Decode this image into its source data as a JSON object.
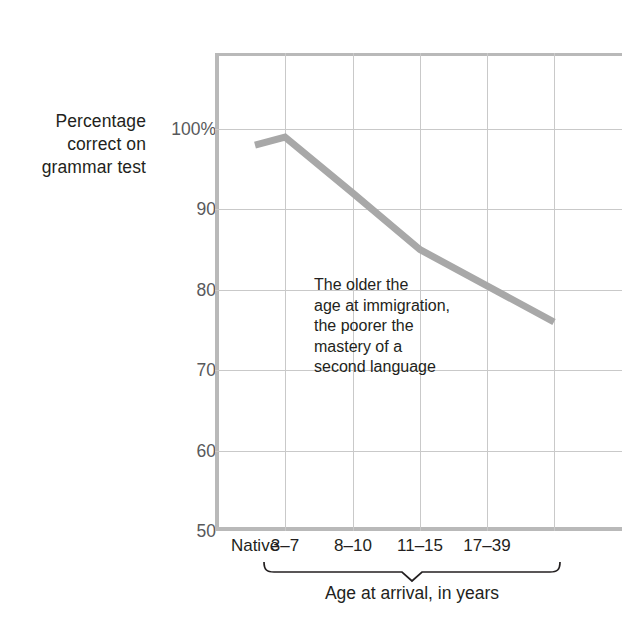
{
  "chart_data": {
    "type": "line",
    "title": "",
    "subtitle": "",
    "xlabel": "Age at arrival, in years",
    "ylabel": "Percentage correct on grammar test",
    "categories": [
      "Native",
      "3–7",
      "8–10",
      "11–15",
      "17–39"
    ],
    "values": [
      98,
      99,
      92,
      85,
      76
    ],
    "series": [
      {
        "name": "Percentage correct on grammar test",
        "values": [
          98,
          99,
          92,
          85,
          76
        ]
      }
    ],
    "ylim": [
      50,
      100
    ],
    "yticks": [
      50,
      60,
      70,
      80,
      90,
      100
    ],
    "ytick_labels": [
      "50",
      "60",
      "70",
      "80",
      "90",
      "100%"
    ],
    "grid": "both",
    "legend": "none",
    "line_color": "#a8a8a8",
    "line_width_px": 7,
    "annotations": [
      {
        "text": "The older the age at immigration, the poorer the mastery of a second language",
        "lines": [
          "The older the",
          "age at immigration,",
          "the poorer the",
          "mastery of a",
          "second language"
        ]
      }
    ]
  },
  "y_axis": {
    "title_lines": [
      "Percentage",
      "correct on",
      "grammar test"
    ],
    "ticks": [
      {
        "value": 100,
        "label": "100%"
      },
      {
        "value": 90,
        "label": "90"
      },
      {
        "value": 80,
        "label": "80"
      },
      {
        "value": 70,
        "label": "70"
      },
      {
        "value": 60,
        "label": "60"
      },
      {
        "value": 50,
        "label": "50"
      }
    ]
  },
  "x_axis": {
    "title": "Age at arrival, in years",
    "ticks": [
      {
        "label": "Native"
      },
      {
        "label": "3–7"
      },
      {
        "label": "8–10"
      },
      {
        "label": "11–15"
      },
      {
        "label": "17–39"
      }
    ]
  },
  "annotation": {
    "line1": "The older the",
    "line2": "age at immigration,",
    "line3": "the poorer the",
    "line4": "mastery of a",
    "line5": "second language"
  },
  "colors": {
    "line": "#a8a8a8",
    "axis": "#b9b9b9",
    "grid": "#c9c9c9",
    "text": "#231f20",
    "tick_text": "#58595b",
    "background": "#ffffff"
  }
}
